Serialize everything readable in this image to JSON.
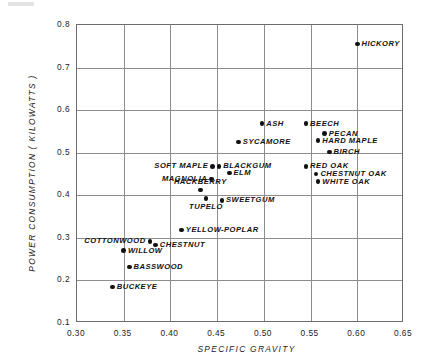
{
  "chart_data": {
    "type": "scatter",
    "title": "",
    "xlabel": "SPECIFIC GRAVITY",
    "ylabel": "POWER CONSUMPTION  ( KILOWATTS )",
    "xlim": [
      0.3,
      0.65
    ],
    "ylim": [
      0.1,
      0.8
    ],
    "xticks": [
      "0.30",
      "0.35",
      "0.40",
      "0.45",
      "0.50",
      "0.55",
      "0.60",
      "0.65"
    ],
    "xtick_values": [
      0.3,
      0.35,
      0.4,
      0.45,
      0.5,
      0.55,
      0.6,
      0.65
    ],
    "yticks": [
      "0.1",
      "0.2",
      "0.3",
      "0.4",
      "0.5",
      "0.6",
      "0.7",
      "0.8"
    ],
    "ytick_values": [
      0.1,
      0.2,
      0.3,
      0.4,
      0.5,
      0.6,
      0.7,
      0.8
    ],
    "grid": true,
    "legend": "none",
    "marker": "filled-circle",
    "marker_color": "#111111",
    "points": [
      {
        "label": "HICKORY",
        "x": 0.6,
        "y": 0.755,
        "label_pos": "right"
      },
      {
        "label": "ASH",
        "x": 0.498,
        "y": 0.568,
        "label_pos": "right"
      },
      {
        "label": "BEECH",
        "x": 0.545,
        "y": 0.568,
        "label_pos": "right"
      },
      {
        "label": "PECAN",
        "x": 0.565,
        "y": 0.545,
        "label_pos": "right"
      },
      {
        "label": "HARD MAPLE",
        "x": 0.558,
        "y": 0.528,
        "label_pos": "right"
      },
      {
        "label": "BIRCH",
        "x": 0.57,
        "y": 0.502,
        "label_pos": "right"
      },
      {
        "label": "SYCAMORE",
        "x": 0.473,
        "y": 0.525,
        "label_pos": "right"
      },
      {
        "label": "RED OAK",
        "x": 0.545,
        "y": 0.468,
        "label_pos": "right"
      },
      {
        "label": "CHESTNUT OAK",
        "x": 0.556,
        "y": 0.45,
        "label_pos": "right"
      },
      {
        "label": "WHITE OAK",
        "x": 0.558,
        "y": 0.432,
        "label_pos": "right"
      },
      {
        "label": "SOFT MAPLE",
        "x": 0.445,
        "y": 0.468,
        "label_pos": "left"
      },
      {
        "label": "BLACKGUM",
        "x": 0.452,
        "y": 0.468,
        "label_pos": "right"
      },
      {
        "label": "ELM",
        "x": 0.463,
        "y": 0.452,
        "label_pos": "right"
      },
      {
        "label": "MAGNOLIA",
        "x": 0.444,
        "y": 0.438,
        "label_pos": "left"
      },
      {
        "label": "HACKBERRY",
        "x": 0.432,
        "y": 0.412,
        "label_pos": "above"
      },
      {
        "label": "TUPELO",
        "x": 0.438,
        "y": 0.392,
        "label_pos": "below"
      },
      {
        "label": "SWEETGUM",
        "x": 0.455,
        "y": 0.388,
        "label_pos": "right"
      },
      {
        "label": "YELLOW-POPLAR",
        "x": 0.412,
        "y": 0.318,
        "label_pos": "right"
      },
      {
        "label": "COTTONWOOD",
        "x": 0.378,
        "y": 0.292,
        "label_pos": "left"
      },
      {
        "label": "CHESTNUT",
        "x": 0.384,
        "y": 0.283,
        "label_pos": "right"
      },
      {
        "label": "WILLOW",
        "x": 0.35,
        "y": 0.27,
        "label_pos": "right"
      },
      {
        "label": "BASSWOOD",
        "x": 0.356,
        "y": 0.232,
        "label_pos": "right"
      },
      {
        "label": "BUCKEYE",
        "x": 0.338,
        "y": 0.185,
        "label_pos": "right"
      }
    ]
  }
}
